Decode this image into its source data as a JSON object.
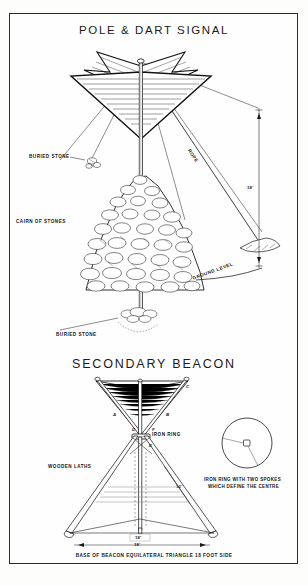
{
  "sheet": {
    "background_color": "#fdfdfb",
    "frame_color": "#2a2a2a"
  },
  "top_diagram": {
    "title": "POLE & DART SIGNAL",
    "labels": {
      "buried_stone_upper": "BURIED STONE",
      "cairn_of_stones": "CAIRN OF STONES",
      "rope": "ROPE",
      "ground_level": "GROUND LEVEL",
      "buried_stone_lower": "BURIED STONE",
      "height_dimension": "18'"
    }
  },
  "bottom_diagram": {
    "title": "SECONDARY BEACON",
    "labels": {
      "iron_ring": "IRON RING",
      "wooden_laths": "WOODEN LATHS",
      "side_dimension": "12'",
      "base_dimension": "18'",
      "base_tick": "18'"
    },
    "leg_letters": [
      "A",
      "B",
      "C",
      "D",
      "E",
      "F"
    ],
    "caption": "BASE OF BEACON EQUILATERAL TRIANGLE 18 FOOT SIDE"
  },
  "detail_inset": {
    "caption_line_1": "IRON RING WITH TWO SPOKES",
    "caption_line_2": "WHICH DEFINE THE CENTRE"
  },
  "colors": {
    "ink": "#141414",
    "line": "#2a2a2a",
    "paper": "#fefefe",
    "light_line": "#8a8a8a"
  }
}
